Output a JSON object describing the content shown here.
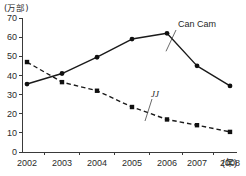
{
  "chart_data": {
    "type": "line",
    "title": "",
    "xlabel": "年",
    "ylabel": "万部",
    "y_unit_label": "(万部)",
    "x_unit_label": "(年)",
    "categories": [
      "2002",
      "2003",
      "2004",
      "2005",
      "2006",
      "2007",
      "2008"
    ],
    "ylim": [
      0,
      70
    ],
    "yticks": [
      0,
      10,
      20,
      30,
      40,
      50,
      60,
      70
    ],
    "ytick_labels": [
      "0",
      "10",
      "20",
      "30",
      "40",
      "50",
      "60",
      "70"
    ],
    "grid": false,
    "legend_position": "inline-annotation",
    "series": [
      {
        "name": "Can Cam",
        "label": "Can Cam",
        "style": "solid",
        "marker": "circle",
        "color": "#1a1a1a",
        "values": [
          35.5,
          41.0,
          49.5,
          59.0,
          62.0,
          45.0,
          34.5
        ]
      },
      {
        "name": "JJ",
        "label": "JJ",
        "style": "dashed",
        "marker": "square",
        "color": "#1a1a1a",
        "values": [
          47.0,
          36.5,
          32.0,
          23.5,
          17.0,
          14.0,
          10.5
        ]
      }
    ],
    "annotations": [
      {
        "text": "Can Cam",
        "target_series": "Can Cam",
        "target_category": "2006"
      },
      {
        "text": "JJ",
        "target_series": "JJ",
        "target_category": "2006"
      }
    ]
  },
  "plot_geometry": {
    "x_axis_start": 22,
    "x_axis_end": 237,
    "y_axis_top": 18,
    "y_axis_bottom": 152,
    "category_positions": [
      27,
      62,
      97,
      132,
      167,
      197,
      230
    ]
  }
}
